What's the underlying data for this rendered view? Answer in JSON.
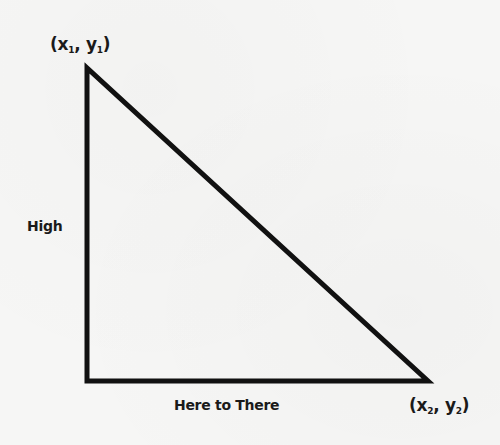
{
  "diagram": {
    "type": "right-triangle",
    "vertices": {
      "top": {
        "label_x": "x",
        "label_y": "y",
        "subscript": "1"
      },
      "bottom_right": {
        "label_x": "x",
        "label_y": "y",
        "subscript": "2"
      }
    },
    "side_labels": {
      "vertical": "High",
      "horizontal": "Here to There"
    },
    "colors": {
      "line": "#111111",
      "background": "#f6f6f5"
    }
  }
}
